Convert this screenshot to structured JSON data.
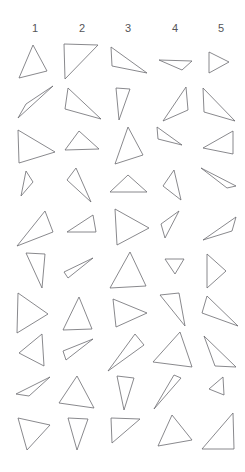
{
  "page": {
    "background_color": "#ffffff",
    "stroke_color": "#6b6b70",
    "header_text_color": "#555558",
    "width": 245,
    "height": 472
  },
  "columns": [
    {
      "label": "1",
      "x": 35
    },
    {
      "label": "2",
      "x": 82
    },
    {
      "label": "3",
      "x": 128
    },
    {
      "label": "4",
      "x": 175
    },
    {
      "label": "5",
      "x": 221
    }
  ],
  "grid": {
    "rows": 10,
    "cols": 5,
    "row_tops": [
      42,
      84,
      126,
      168,
      210,
      250,
      292,
      334,
      376,
      418
    ],
    "col_lefts": [
      14,
      61,
      107,
      154,
      200
    ],
    "cell_width": 46,
    "cell_height": 42
  },
  "shapes": [
    {
      "row": 1,
      "col": 1,
      "name": "triangle-r1c1",
      "points": "33,45 19,78 47,71"
    },
    {
      "row": 1,
      "col": 2,
      "name": "triangle-r1c2",
      "points": "64,44 98,45 65,79"
    },
    {
      "row": 1,
      "col": 3,
      "name": "triangle-r1c3",
      "points": "111,47 147,73 112,66"
    },
    {
      "row": 1,
      "col": 4,
      "name": "triangle-r1c4",
      "points": "159,60 192,61 182,70"
    },
    {
      "row": 1,
      "col": 5,
      "name": "triangle-r1c5",
      "points": "209,52 229,62 209,73"
    },
    {
      "row": 2,
      "col": 1,
      "name": "triangle-r2c1",
      "points": "53,86 18,118 26,104"
    },
    {
      "row": 2,
      "col": 2,
      "name": "triangle-r2c2",
      "points": "68,88 101,119 65,109"
    },
    {
      "row": 2,
      "col": 3,
      "name": "triangle-r2c3",
      "points": "116,88 130,89 119,120"
    },
    {
      "row": 2,
      "col": 4,
      "name": "triangle-r2c4",
      "points": "186,87 163,121 188,110"
    },
    {
      "row": 2,
      "col": 5,
      "name": "triangle-r2c5",
      "points": "203,88 235,121 204,112"
    },
    {
      "row": 3,
      "col": 1,
      "name": "triangle-r3c1",
      "points": "18,130 55,152 19,163"
    },
    {
      "row": 3,
      "col": 2,
      "name": "triangle-r3c2",
      "points": "79,131 99,149 65,150"
    },
    {
      "row": 3,
      "col": 3,
      "name": "triangle-r3c3",
      "points": "128,127 143,155 115,164"
    },
    {
      "row": 3,
      "col": 4,
      "name": "triangle-r3c4",
      "points": "157,127 182,145 158,139"
    },
    {
      "row": 3,
      "col": 5,
      "name": "triangle-r3c5",
      "points": "233,131 203,148 233,154"
    },
    {
      "row": 4,
      "col": 1,
      "name": "triangle-r4c1",
      "points": "26,171 33,182 21,196"
    },
    {
      "row": 4,
      "col": 2,
      "name": "triangle-r4c2",
      "points": "76,168 91,202 67,180"
    },
    {
      "row": 4,
      "col": 3,
      "name": "triangle-r4c3",
      "points": "128,175 147,192 110,192"
    },
    {
      "row": 4,
      "col": 4,
      "name": "triangle-r4c4",
      "points": "174,170 181,200 163,186"
    },
    {
      "row": 4,
      "col": 5,
      "name": "triangle-r4c5",
      "points": "201,168 236,186 227,188"
    },
    {
      "row": 5,
      "col": 1,
      "name": "triangle-r5c1",
      "points": "45,211 53,232 17,246"
    },
    {
      "row": 5,
      "col": 2,
      "name": "triangle-r5c2",
      "points": "93,215 96,232 67,232"
    },
    {
      "row": 5,
      "col": 3,
      "name": "triangle-r5c3",
      "points": "115,209 149,228 117,245"
    },
    {
      "row": 5,
      "col": 4,
      "name": "triangle-r5c4",
      "points": "179,211 165,238 161,224"
    },
    {
      "row": 5,
      "col": 5,
      "name": "triangle-r5c5",
      "points": "236,217 203,240 232,231"
    },
    {
      "row": 6,
      "col": 1,
      "name": "triangle-r6c1",
      "points": "26,253 45,254 42,288"
    },
    {
      "row": 6,
      "col": 2,
      "name": "triangle-r6c2",
      "points": "93,258 64,272 68,278"
    },
    {
      "row": 6,
      "col": 3,
      "name": "triangle-r6c3",
      "points": "130,252 146,286 110,288"
    },
    {
      "row": 6,
      "col": 4,
      "name": "triangle-r6c4",
      "points": "165,259 184,259 175,274"
    },
    {
      "row": 6,
      "col": 5,
      "name": "triangle-r6c5",
      "points": "207,254 226,271 207,288"
    },
    {
      "row": 7,
      "col": 1,
      "name": "triangle-r7c1",
      "points": "18,293 48,314 17,333"
    },
    {
      "row": 7,
      "col": 2,
      "name": "triangle-r7c2",
      "points": "79,297 92,329 63,330"
    },
    {
      "row": 7,
      "col": 3,
      "name": "triangle-r7c3",
      "points": "113,299 147,313 116,327"
    },
    {
      "row": 7,
      "col": 4,
      "name": "triangle-r7c4",
      "points": "179,293 185,326 160,295"
    },
    {
      "row": 7,
      "col": 5,
      "name": "triangle-r7c5",
      "points": "207,296 238,326 202,313"
    },
    {
      "row": 8,
      "col": 1,
      "name": "triangle-r8c1",
      "points": "42,334 19,353 44,366"
    },
    {
      "row": 8,
      "col": 2,
      "name": "triangle-r8c2",
      "points": "93,339 63,351 66,360"
    },
    {
      "row": 8,
      "col": 3,
      "name": "triangle-r8c3",
      "points": "135,334 144,345 108,371"
    },
    {
      "row": 8,
      "col": 4,
      "name": "triangle-r8c4",
      "points": "180,332 192,367 153,362"
    },
    {
      "row": 8,
      "col": 5,
      "name": "triangle-r8c5",
      "points": "204,336 236,367 215,366"
    },
    {
      "row": 9,
      "col": 1,
      "name": "triangle-r9c1",
      "points": "50,377 16,394 29,396"
    },
    {
      "row": 9,
      "col": 2,
      "name": "triangle-r9c2",
      "points": "77,376 94,408 59,403"
    },
    {
      "row": 9,
      "col": 3,
      "name": "triangle-r9c3",
      "points": "117,376 134,378 124,410"
    },
    {
      "row": 9,
      "col": 4,
      "name": "triangle-r9c4",
      "points": "174,375 181,378 154,409"
    },
    {
      "row": 9,
      "col": 5,
      "name": "triangle-r9c5",
      "points": "223,377 209,389 224,395"
    },
    {
      "row": 10,
      "col": 1,
      "name": "triangle-r10c1",
      "points": "18,418 50,425 27,450"
    },
    {
      "row": 10,
      "col": 2,
      "name": "triangle-r10c2",
      "points": "68,418 88,419 77,450"
    },
    {
      "row": 10,
      "col": 3,
      "name": "triangle-r10c3",
      "points": "111,418 140,419 112,443"
    },
    {
      "row": 10,
      "col": 4,
      "name": "triangle-r10c4",
      "points": "172,415 192,440 158,446"
    },
    {
      "row": 10,
      "col": 5,
      "name": "triangle-r10c5",
      "points": "233,413 234,449 202,449"
    }
  ]
}
